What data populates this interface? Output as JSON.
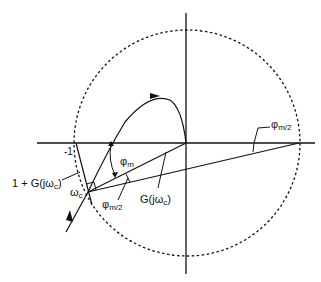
{
  "diagram": {
    "type": "nyquist-phase-margin",
    "labels": {
      "minus_one": "-1",
      "one_plus_g": "1 + G(jω",
      "one_plus_g_sub": "c",
      "one_plus_g_close": ")",
      "omega": "ω",
      "omega_sub": "c",
      "phi": "φ",
      "phi_m_sub": "m",
      "phi_m2_sub": "m/2",
      "g": "G(jω",
      "g_sub": "c",
      "g_close": ")"
    },
    "colors": {
      "stroke": "#111111",
      "background": "#ffffff"
    }
  }
}
